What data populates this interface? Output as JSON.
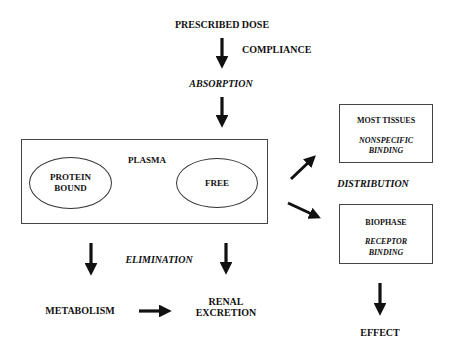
{
  "diagram": {
    "type": "pharmacokinetic-flow",
    "nodes": {
      "prescribed_dose": "PRESCRIBED DOSE",
      "compliance": "COMPLIANCE",
      "absorption": "ABSORPTION",
      "plasma": "PLASMA",
      "protein_bound_line1": "PROTEIN",
      "protein_bound_line2": "BOUND",
      "free": "FREE",
      "distribution": "DISTRIBUTION",
      "most_tissues": "MOST TISSUES",
      "nonspecific_line1": "NONSPECIFIC",
      "nonspecific_line2": "BINDING",
      "biophase": "BIOPHASE",
      "receptor_line1": "RECEPTOR",
      "receptor_line2": "BINDING",
      "elimination": "ELIMINATION",
      "metabolism": "METABOLISM",
      "renal_line1": "RENAL",
      "renal_line2": "EXCRETION",
      "effect": "EFFECT"
    },
    "edges": [
      {
        "from": "PRESCRIBED DOSE",
        "to": "ABSORPTION",
        "label": "COMPLIANCE"
      },
      {
        "from": "ABSORPTION",
        "to": "PLASMA"
      },
      {
        "from": "PROTEIN BOUND",
        "to": "FREE",
        "bidirectional": true
      },
      {
        "from": "PLASMA",
        "to": "MOST TISSUES",
        "label": "DISTRIBUTION"
      },
      {
        "from": "PLASMA",
        "to": "BIOPHASE",
        "label": "DISTRIBUTION"
      },
      {
        "from": "PLASMA",
        "to": "METABOLISM",
        "label": "ELIMINATION"
      },
      {
        "from": "PLASMA",
        "to": "RENAL EXCRETION",
        "label": "ELIMINATION"
      },
      {
        "from": "METABOLISM",
        "to": "RENAL EXCRETION"
      },
      {
        "from": "BIOPHASE",
        "to": "EFFECT"
      }
    ]
  }
}
